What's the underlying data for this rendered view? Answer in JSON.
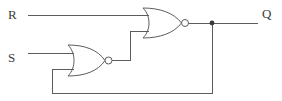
{
  "diagram": {
    "type": "logic-circuit-schematic",
    "background_color": "#ffffff",
    "line_color": "#5c5c5c",
    "label_color": "#3b3b3b"
  },
  "labels": {
    "input_r": "R",
    "input_s": "S",
    "output_q": "Q"
  },
  "gates": [
    {
      "id": "nor-top",
      "name": "NOR gate (top)",
      "kind": "NOR",
      "inputs": [
        "R",
        "feedback from bottom NOR output"
      ],
      "output": "Q"
    },
    {
      "id": "nor-bottom",
      "name": "NOR gate (bottom)",
      "kind": "NOR",
      "inputs": [
        "S",
        "feedback from Q"
      ],
      "output": "to top NOR lower input"
    }
  ],
  "nodes": [
    {
      "id": "q-junction",
      "name": "Q output junction",
      "type": "wire-junction-dot"
    }
  ]
}
